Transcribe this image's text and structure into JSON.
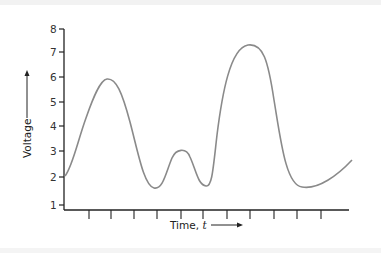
{
  "chart_data": {
    "type": "line",
    "title": "",
    "xlabel": "Time, t",
    "xlabel_main": "Time, ",
    "xlabel_var": "t",
    "ylabel": "Voltage",
    "ylim": [
      1,
      8
    ],
    "yticks": [
      1,
      2,
      3,
      4,
      5,
      6,
      7,
      8
    ],
    "xtick_count": 11,
    "xtick_labels": [],
    "grid": false,
    "legend": null,
    "series": [
      {
        "name": "Voltage",
        "color": "#8a8a8a",
        "points": [
          {
            "t": 0.0,
            "v": 2.0
          },
          {
            "t": 0.5,
            "v": 3.2
          },
          {
            "t": 1.0,
            "v": 4.9
          },
          {
            "t": 1.5,
            "v": 5.85
          },
          {
            "t": 2.0,
            "v": 5.6
          },
          {
            "t": 2.5,
            "v": 4.2
          },
          {
            "t": 3.0,
            "v": 2.4
          },
          {
            "t": 3.5,
            "v": 1.6
          },
          {
            "t": 4.0,
            "v": 1.9
          },
          {
            "t": 4.5,
            "v": 2.8
          },
          {
            "t": 4.8,
            "v": 3.0
          },
          {
            "t": 5.2,
            "v": 2.7
          },
          {
            "t": 5.6,
            "v": 1.8
          },
          {
            "t": 6.0,
            "v": 1.7
          },
          {
            "t": 6.5,
            "v": 5.0
          },
          {
            "t": 7.0,
            "v": 7.0
          },
          {
            "t": 7.4,
            "v": 7.3
          },
          {
            "t": 8.0,
            "v": 6.8
          },
          {
            "t": 8.5,
            "v": 4.6
          },
          {
            "t": 9.0,
            "v": 2.2
          },
          {
            "t": 9.5,
            "v": 1.6
          },
          {
            "t": 10.0,
            "v": 1.7
          },
          {
            "t": 11.0,
            "v": 2.2
          },
          {
            "t": 12.0,
            "v": 2.7
          }
        ]
      }
    ],
    "features": {
      "start": 2.0,
      "peak_1": 5.9,
      "trough_1": 1.6,
      "peak_2": 3.0,
      "trough_2": 1.65,
      "peak_3": 7.3,
      "trough_3": 1.6,
      "end": 2.7
    }
  }
}
